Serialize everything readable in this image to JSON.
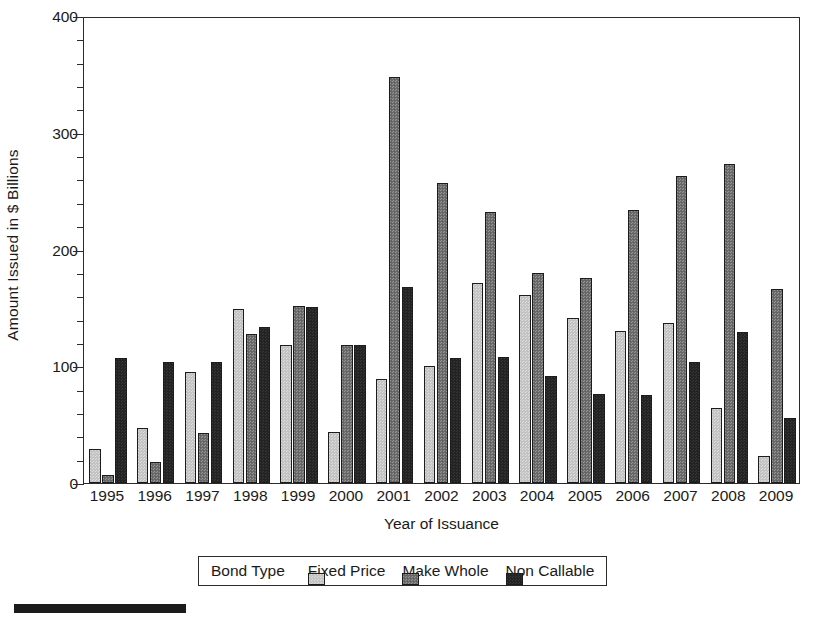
{
  "chart_data": {
    "type": "bar",
    "title": "",
    "xlabel": "Year of Issuance",
    "ylabel": "Amount Issued in $ Billions",
    "ylim": [
      0,
      400
    ],
    "ytick_major": [
      0,
      100,
      200,
      300,
      400
    ],
    "ytick_minor_step": 20,
    "grid": false,
    "legend_position": "bottom",
    "legend_title": "Bond Type",
    "categories": [
      "1995",
      "1996",
      "1997",
      "1998",
      "1999",
      "2000",
      "2001",
      "2002",
      "2003",
      "2004",
      "2005",
      "2006",
      "2007",
      "2008",
      "2009"
    ],
    "series": [
      {
        "name": "Fixed Price",
        "color": "#c3c3c3",
        "values": [
          29,
          47,
          95,
          149,
          118,
          44,
          89,
          100,
          171,
          161,
          141,
          130,
          137,
          64,
          23
        ]
      },
      {
        "name": "Make Whole",
        "color": "#6f6f6f",
        "values": [
          7,
          18,
          43,
          128,
          152,
          118,
          348,
          257,
          232,
          180,
          176,
          234,
          263,
          273,
          166
        ]
      },
      {
        "name": "Non Callable",
        "color": "#232323",
        "values": [
          107,
          104,
          104,
          134,
          151,
          118,
          168,
          107,
          108,
          92,
          76,
          75,
          104,
          129,
          56
        ]
      }
    ]
  },
  "axis": {
    "y_title": "Amount Issued in $ Billions",
    "x_title": "Year of Issuance"
  },
  "legend": {
    "title": "Bond Type",
    "items": [
      {
        "label": "Fixed Price"
      },
      {
        "label": "Make Whole"
      },
      {
        "label": "Non Callable"
      }
    ]
  }
}
